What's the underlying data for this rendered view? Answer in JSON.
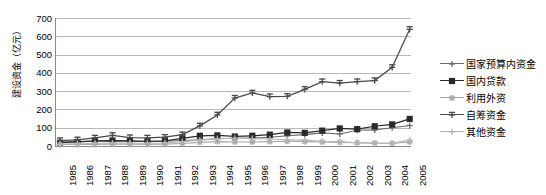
{
  "chart_data": {
    "type": "line",
    "title": "",
    "xlabel": "",
    "ylabel": "建设资金（亿元）",
    "ylim": [
      0,
      700
    ],
    "ytick_step": 100,
    "yticks": [
      "700",
      "600",
      "500",
      "400",
      "300",
      "200",
      "100",
      "0"
    ],
    "grid": true,
    "legend_position": "right",
    "categories": [
      "1985",
      "1986",
      "1987",
      "1988",
      "1989",
      "1990",
      "1991",
      "1992",
      "1993",
      "1994",
      "1995",
      "1996",
      "1997",
      "1998",
      "1999",
      "2000",
      "2001",
      "2002",
      "2003",
      "2004",
      "2005"
    ],
    "series": [
      {
        "name": "国家预算内资金",
        "color": "#6b6b6b",
        "marker": "plus",
        "values": [
          22,
          24,
          26,
          28,
          26,
          25,
          26,
          30,
          34,
          40,
          42,
          44,
          48,
          56,
          62,
          72,
          66,
          86,
          88,
          100,
          112
        ]
      },
      {
        "name": "国内贷款",
        "color": "#2a2a2a",
        "marker": "square",
        "values": [
          18,
          22,
          28,
          30,
          28,
          26,
          28,
          42,
          56,
          58,
          52,
          56,
          62,
          74,
          72,
          84,
          96,
          92,
          108,
          118,
          148
        ]
      },
      {
        "name": "利用外资",
        "color": "#a8a8a8",
        "marker": "star",
        "values": [
          8,
          8,
          9,
          10,
          10,
          9,
          10,
          14,
          20,
          24,
          22,
          22,
          24,
          26,
          24,
          22,
          20,
          18,
          16,
          14,
          22
        ]
      },
      {
        "name": "自筹资金",
        "color": "#4a4a4a",
        "marker": "plus-bar",
        "values": [
          30,
          34,
          44,
          58,
          46,
          44,
          48,
          62,
          110,
          170,
          262,
          290,
          270,
          272,
          310,
          352,
          344,
          352,
          358,
          430,
          638
        ]
      },
      {
        "name": "其他资金",
        "color": "#b5b5b5",
        "marker": "plus",
        "values": [
          10,
          12,
          14,
          16,
          16,
          14,
          16,
          24,
          32,
          40,
          42,
          40,
          38,
          34,
          32,
          26,
          24,
          18,
          14,
          16,
          32
        ]
      }
    ]
  }
}
